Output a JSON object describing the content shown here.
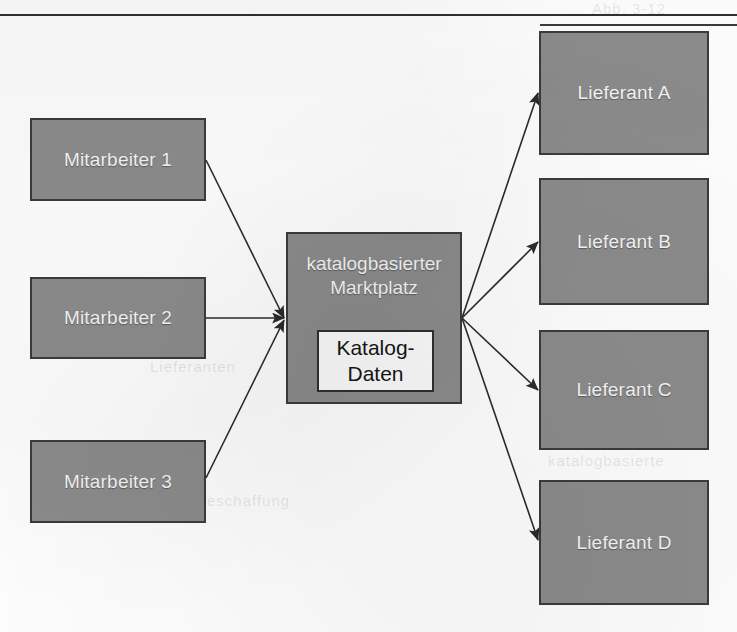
{
  "page": {
    "background_color": "#fdfdfd",
    "rules": [
      {
        "name": "top-rule",
        "x": 0,
        "y": 14,
        "width": 737
      },
      {
        "name": "second-rule",
        "x": 540,
        "y": 24,
        "width": 197
      }
    ],
    "ghost_text": [
      {
        "text": "Abb. 3-12",
        "x": 592,
        "y": 0
      },
      {
        "text": "Marktplatz",
        "x": 560,
        "y": 188
      },
      {
        "text": "Lieferanten",
        "x": 150,
        "y": 358
      },
      {
        "text": "katalogbasierte",
        "x": 548,
        "y": 452
      },
      {
        "text": "Beschaffung",
        "x": 196,
        "y": 492
      }
    ]
  },
  "diagram": {
    "type": "flow-diagram",
    "fill_color": "#8b8b8b",
    "border_color": "#3b3b3b",
    "label_color": "#f4f4f4",
    "inner_fill_color": "#fafafa",
    "inner_label_color": "#151515",
    "nodes": [
      {
        "id": "mitarbeiter-1",
        "label": "Mitarbeiter 1",
        "x": 30,
        "y": 118,
        "width": 176,
        "height": 83,
        "role": "source"
      },
      {
        "id": "mitarbeiter-2",
        "label": "Mitarbeiter 2",
        "x": 30,
        "y": 277,
        "width": 176,
        "height": 82,
        "role": "source"
      },
      {
        "id": "mitarbeiter-3",
        "label": "Mitarbeiter 3",
        "x": 30,
        "y": 440,
        "width": 176,
        "height": 83,
        "role": "source"
      },
      {
        "id": "marktplatz",
        "label": "katalogbasierter\nMarktplatz",
        "title_line_1": "katalogbasierter",
        "title_line_2": "Marktplatz",
        "x": 286,
        "y": 232,
        "width": 176,
        "height": 172,
        "role": "hub"
      },
      {
        "id": "lieferant-a",
        "label": "Lieferant A",
        "x": 539,
        "y": 31,
        "width": 170,
        "height": 124,
        "role": "target"
      },
      {
        "id": "lieferant-b",
        "label": "Lieferant B",
        "x": 539,
        "y": 178,
        "width": 170,
        "height": 127,
        "role": "target"
      },
      {
        "id": "lieferant-c",
        "label": "Lieferant C",
        "x": 539,
        "y": 330,
        "width": 170,
        "height": 120,
        "role": "target"
      },
      {
        "id": "lieferant-d",
        "label": "Lieferant D",
        "x": 539,
        "y": 480,
        "width": 170,
        "height": 125,
        "role": "target"
      }
    ],
    "inner_node": {
      "id": "katalog-daten",
      "line_1": "Katalog-",
      "line_2": "Daten",
      "x": 317,
      "y": 330,
      "width": 117,
      "height": 62
    },
    "edges": [
      {
        "id": "edge-m1-hub",
        "from": "mitarbeiter-1",
        "to": "marktplatz",
        "x1": 206,
        "y1": 160,
        "x2": 284,
        "y2": 318,
        "arrow": "end"
      },
      {
        "id": "edge-m2-hub",
        "from": "mitarbeiter-2",
        "to": "marktplatz",
        "x1": 206,
        "y1": 318,
        "x2": 284,
        "y2": 318,
        "arrow": "end"
      },
      {
        "id": "edge-m3-hub",
        "from": "mitarbeiter-3",
        "to": "marktplatz",
        "x1": 206,
        "y1": 478,
        "x2": 284,
        "y2": 320,
        "arrow": "end"
      },
      {
        "id": "edge-hub-a",
        "from": "marktplatz",
        "to": "lieferant-a",
        "x1": 462,
        "y1": 318,
        "x2": 538,
        "y2": 93,
        "arrow": "end"
      },
      {
        "id": "edge-hub-b",
        "from": "marktplatz",
        "to": "lieferant-b",
        "x1": 462,
        "y1": 318,
        "x2": 538,
        "y2": 242,
        "arrow": "end"
      },
      {
        "id": "edge-hub-c",
        "from": "marktplatz",
        "to": "lieferant-c",
        "x1": 462,
        "y1": 318,
        "x2": 538,
        "y2": 390,
        "arrow": "end"
      },
      {
        "id": "edge-hub-d",
        "from": "marktplatz",
        "to": "lieferant-d",
        "x1": 462,
        "y1": 318,
        "x2": 538,
        "y2": 540,
        "arrow": "end"
      }
    ],
    "edge_color": "#2b2b2b",
    "edge_width": 1.6
  }
}
